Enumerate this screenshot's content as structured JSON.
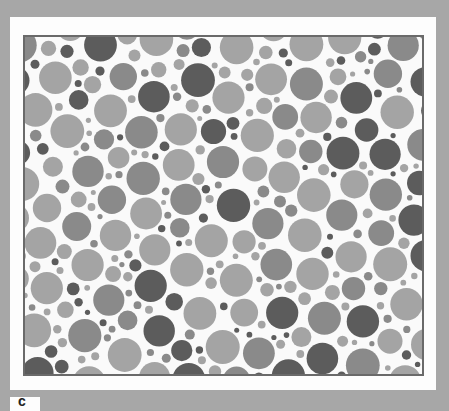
{
  "plate": {
    "type": "pseudo-isochromatic dot plate",
    "colors": {
      "background": "#a7a7a7",
      "card": "#fdfdfd",
      "frame": "#6a6a6a",
      "dot_light": "#a4a4a4",
      "dot_mid": "#8a8a8a",
      "dot_dark": "#5c5c5c"
    }
  },
  "label": {
    "text": "c"
  }
}
